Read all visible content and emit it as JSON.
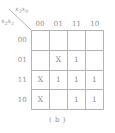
{
  "figure": {
    "caption": "( b )",
    "type": "karnaugh-map"
  },
  "axes": {
    "column_variable_label": "x₃x₀",
    "column_variable_base": "x",
    "column_variable_sub1": "3",
    "column_variable_sub2": "0",
    "row_variable_label": "x₂x₁",
    "row_variable_base": "x",
    "row_variable_sub1": "2",
    "row_variable_sub2": "1"
  },
  "column_headers": [
    "00",
    "01",
    "11",
    "10"
  ],
  "row_headers": [
    "00",
    "01",
    "11",
    "10"
  ],
  "cells": [
    [
      "",
      "",
      "",
      ""
    ],
    [
      "",
      "X",
      "1",
      ""
    ],
    [
      "X",
      "1",
      "1",
      "1"
    ],
    [
      "X",
      "",
      "1",
      "1"
    ]
  ],
  "colors": {
    "grid_line": "#b4b4b4",
    "text": "#8f8f8f",
    "background": "#ffffff"
  }
}
